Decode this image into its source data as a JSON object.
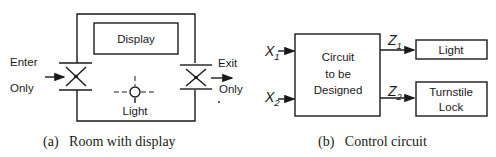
{
  "figure_a": {
    "caption": "(a)   Room with display",
    "display_label": "Display",
    "light_label": "Light",
    "entry": {
      "line1": "Enter",
      "line2": "Only"
    },
    "exit": {
      "line1": "Exit",
      "line2": "Only"
    }
  },
  "figure_b": {
    "caption": "(b)   Control circuit",
    "circuit_label": [
      "Circuit",
      "to be",
      "Designed"
    ],
    "inputs": [
      {
        "name": "X",
        "sub": "1"
      },
      {
        "name": "X",
        "sub": "2"
      }
    ],
    "outputs": [
      {
        "name": "Z",
        "sub": "1"
      },
      {
        "name": "Z",
        "sub": "2"
      }
    ],
    "light_box": "Light",
    "lock_box": [
      "Turnstile",
      "Lock"
    ]
  }
}
